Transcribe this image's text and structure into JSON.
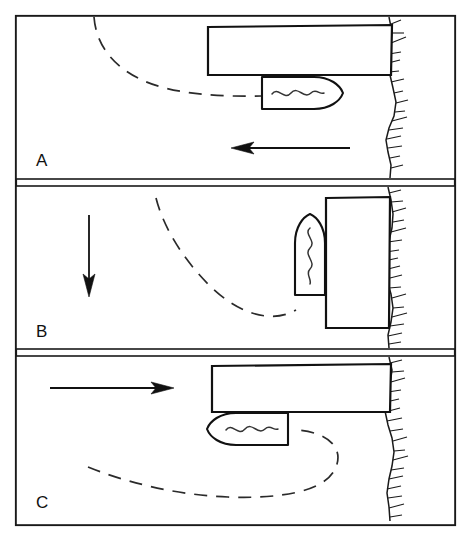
{
  "figure": {
    "width": 471,
    "height": 543,
    "background_color": "#ffffff",
    "ink_color": "#111111"
  },
  "panels": [
    {
      "id": "panel-a",
      "label": "A",
      "label_x": 36,
      "label_y": 166,
      "frame": {
        "x": 16,
        "y": 16,
        "width": 439,
        "height": 163
      },
      "dock": {
        "name": "pier",
        "orientation": "horizontal",
        "x": 208,
        "y": 27,
        "width": 182,
        "height": 48
      },
      "boat": {
        "name": "vessel",
        "heading": "right",
        "x": 262,
        "y": 76,
        "width": 78,
        "height": 33
      },
      "track": {
        "name": "approach-track",
        "style": "dashed",
        "description": "curve sweeping from upper left down to the vessel stern"
      },
      "flow_arrow": {
        "name": "current-arrow",
        "direction": "left",
        "x1": 350,
        "y1": 148,
        "x2": 232,
        "y2": 148
      }
    },
    {
      "id": "panel-b",
      "label": "B",
      "label_x": 36,
      "label_y": 337,
      "frame": {
        "x": 16,
        "y": 186,
        "width": 439,
        "height": 163
      },
      "dock": {
        "name": "pier",
        "orientation": "vertical",
        "x": 326,
        "y": 198,
        "width": 62,
        "height": 130
      },
      "boat": {
        "name": "vessel",
        "heading": "up",
        "x": 294,
        "y": 215,
        "width": 32,
        "height": 80
      },
      "track": {
        "name": "approach-track",
        "style": "dashed",
        "description": "curve sweeping from upper middle down and around to the vessel stern"
      },
      "flow_arrow": {
        "name": "current-arrow",
        "direction": "down",
        "x1": 89,
        "y1": 215,
        "x2": 89,
        "y2": 296
      }
    },
    {
      "id": "panel-c",
      "label": "C",
      "label_x": 36,
      "label_y": 508,
      "frame": {
        "x": 16,
        "y": 356,
        "width": 439,
        "height": 169
      },
      "dock": {
        "name": "pier",
        "orientation": "horizontal",
        "x": 212,
        "y": 366,
        "width": 178,
        "height": 46
      },
      "boat": {
        "name": "vessel",
        "heading": "left",
        "x": 208,
        "y": 413,
        "width": 80,
        "height": 33
      },
      "track": {
        "name": "approach-track",
        "style": "dashed",
        "description": "curve from lower left sweeping right into a U-turn up to the vessel stern"
      },
      "flow_arrow": {
        "name": "current-arrow",
        "direction": "right",
        "x1": 50,
        "y1": 388,
        "x2": 174,
        "y2": 388
      }
    }
  ],
  "shoreline": {
    "name": "shoreline",
    "style": "wavy line with hatch ticks on the land side",
    "land_side": "right",
    "stroke_color": "#1a1a1a"
  }
}
